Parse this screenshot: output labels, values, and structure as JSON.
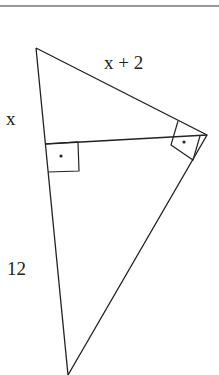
{
  "diagram": {
    "type": "right-triangle-with-altitude",
    "labels": {
      "hypotenuse_top": "x + 2",
      "left_upper": "x",
      "left_lower": "12"
    },
    "colors": {
      "stroke": "#222222",
      "background": "#ffffff"
    },
    "right_angle_markers": 2
  }
}
